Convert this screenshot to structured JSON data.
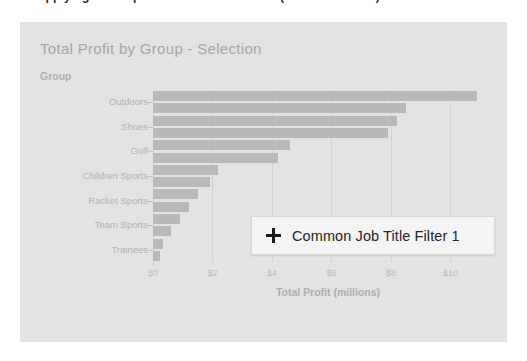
{
  "top_text": "After applying a Group filter to the Dashboard (not shown here)",
  "panel": {
    "title": "Total Profit by Group - Selection",
    "y_axis_title": "Group",
    "x_axis_title": "Total Profit (millions)"
  },
  "filter_chip": {
    "icon": "plus-icon",
    "label": "Common Job Title Filter 1"
  },
  "colors": {
    "panel_background": "#e3e3e3",
    "bar": "#b9b9b9",
    "muted_text": "#b0b0b0",
    "chip_background": "#f4f4f4",
    "chip_border": "#d8d8d8",
    "chip_text": "#262626"
  },
  "chart_data": {
    "type": "bar",
    "orientation": "horizontal",
    "title": "Total Profit by Group - Selection",
    "xlabel": "Total Profit (millions)",
    "ylabel": "Group",
    "xlim": [
      0,
      11.6
    ],
    "grid": false,
    "legend": "none",
    "tick_labels": [
      "$0",
      "$2",
      "$4",
      "$6",
      "$8",
      "$10"
    ],
    "tick_values": [
      0,
      2,
      4,
      6,
      8,
      10
    ],
    "categories": [
      "Outdoors",
      "Shoes",
      "Golf",
      "Children Sports",
      "Racket Sports",
      "Team Sports",
      "Trainees"
    ],
    "bars": [
      {
        "category": "Outdoors",
        "value": 10.9
      },
      {
        "category": "Outdoors",
        "value": 8.5
      },
      {
        "category": "Shoes",
        "value": 8.2
      },
      {
        "category": "Shoes",
        "value": 7.9
      },
      {
        "category": "Golf",
        "value": 4.6
      },
      {
        "category": "Golf",
        "value": 4.2
      },
      {
        "category": "Children Sports",
        "value": 2.2
      },
      {
        "category": "Children Sports",
        "value": 1.9
      },
      {
        "category": "Racket Sports",
        "value": 1.5
      },
      {
        "category": "Racket Sports",
        "value": 1.2
      },
      {
        "category": "Team Sports",
        "value": 0.9
      },
      {
        "category": "Team Sports",
        "value": 0.6
      },
      {
        "category": "Trainees",
        "value": 0.35
      },
      {
        "category": "Trainees",
        "value": 0.25
      }
    ]
  }
}
